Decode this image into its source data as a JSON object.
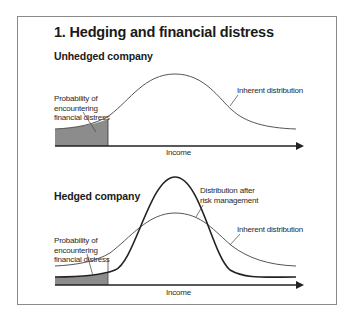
{
  "figure": {
    "title": "1. Hedging and financial distress",
    "panels": [
      {
        "heading": "Unhedged company",
        "labels": {
          "distress_line1": "Probability of",
          "distress_line2": "encountering",
          "distress_line3": "financial distress",
          "inherent": "Inherent distribution",
          "x_axis": "Income"
        }
      },
      {
        "heading": "Hedged company",
        "labels": {
          "distress_line1": "Probability of",
          "distress_line2": "encountering",
          "distress_line3": "financial distress",
          "after_line1": "Distribution after",
          "after_line2": "risk management",
          "inherent": "Inherent distribution",
          "x_axis": "Income"
        }
      }
    ],
    "colors": {
      "frame": "#8a8a8a",
      "curve": "#555555",
      "curve_bold": "#222222",
      "shade": "#8c8c8c",
      "axis": "#222222"
    }
  }
}
